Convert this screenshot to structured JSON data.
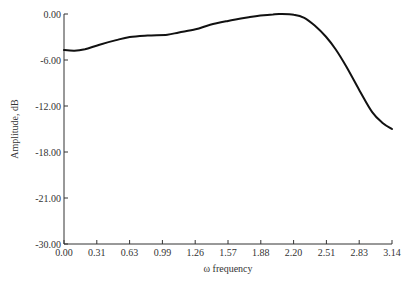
{
  "chart_data": {
    "type": "line",
    "title": "",
    "xlabel": "ω frequency",
    "ylabel": "Amplitude, dB",
    "xlim": [
      0.0,
      3.14
    ],
    "ylim": [
      -30.0,
      0.0
    ],
    "grid": false,
    "legend": null,
    "x_ticks": [
      "0.00",
      "0.31",
      "0.63",
      "0.99",
      "1.26",
      "1.57",
      "1.88",
      "2.20",
      "2.51",
      "2.83",
      "3.14"
    ],
    "y_ticks": [
      "0.00",
      "-6.00",
      "-12.00",
      "-18.00",
      "-21.00",
      "-30.00"
    ],
    "series": [
      {
        "name": "amplitude response",
        "color": "#111111",
        "x": [
          0.0,
          0.1,
          0.2,
          0.34,
          0.5,
          0.63,
          0.8,
          0.99,
          1.1,
          1.26,
          1.4,
          1.57,
          1.78,
          1.88,
          2.0,
          2.07,
          2.2,
          2.3,
          2.4,
          2.51,
          2.6,
          2.7,
          2.83,
          2.95,
          3.05,
          3.14
        ],
        "values": [
          -4.7,
          -4.8,
          -4.6,
          -4.0,
          -3.4,
          -3.0,
          -2.8,
          -2.7,
          -2.4,
          -2.0,
          -1.4,
          -0.9,
          -0.4,
          -0.2,
          -0.05,
          0.0,
          -0.1,
          -0.5,
          -1.5,
          -3.0,
          -4.6,
          -6.8,
          -10.0,
          -12.8,
          -14.2,
          -15.0
        ]
      }
    ]
  }
}
